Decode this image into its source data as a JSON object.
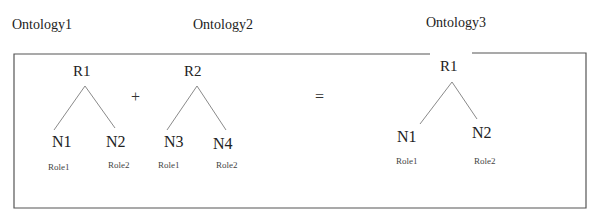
{
  "titles": {
    "ontology1": "Ontology1",
    "ontology2": "Ontology2",
    "ontology3": "Ontology3"
  },
  "operators": {
    "plus": "+",
    "equals": "="
  },
  "trees": [
    {
      "name": "Ontology1",
      "root": "R1",
      "children": [
        {
          "node": "N1",
          "role": "Role1"
        },
        {
          "node": "N2",
          "role": "Role2"
        }
      ]
    },
    {
      "name": "Ontology2",
      "root": "R2",
      "children": [
        {
          "node": "N3",
          "role": "Role1"
        },
        {
          "node": "N4",
          "role": "Role2"
        }
      ]
    },
    {
      "name": "Ontology3",
      "root": "R1",
      "children": [
        {
          "node": "N1",
          "role": "Role1"
        },
        {
          "node": "N2",
          "role": "Role2"
        }
      ]
    }
  ],
  "colors": {
    "border": "#555555",
    "edge": "#8a8a8a",
    "text": "#222222"
  }
}
